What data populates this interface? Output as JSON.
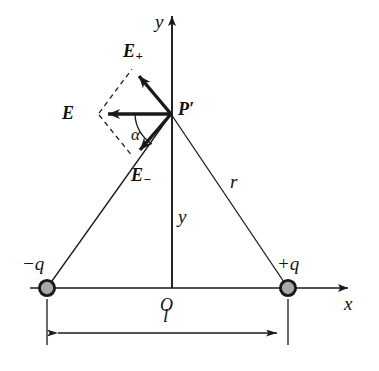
{
  "figure": {
    "type": "physics-vector-diagram",
    "background_color": "#ffffff",
    "stroke_color": "#1a1a1a",
    "charge_fill_color": "#a8a8a8",
    "charge_ring_color": "#1a1a1a"
  },
  "axes": {
    "y_label": "y",
    "x_label": "x",
    "origin_label": "O",
    "y_axis": {
      "x": 172,
      "top_y": 10,
      "bottom_y": 288
    },
    "x_axis": {
      "y": 288,
      "left_x": 30,
      "right_x": 355
    }
  },
  "point": {
    "label": "P",
    "prime": "′",
    "full_label": "P′",
    "x": 171,
    "y": 114
  },
  "charges": [
    {
      "name": "negative-charge",
      "label_sign": "−",
      "label_symbol": "q",
      "full_label": "−q",
      "x": 47,
      "y": 288,
      "radius": 8
    },
    {
      "name": "positive-charge",
      "label_sign": "+",
      "label_symbol": "q",
      "full_label": "+q",
      "x": 288,
      "y": 288,
      "radius": 8
    }
  ],
  "vectors": [
    {
      "name": "E-plus",
      "label": "E",
      "subscript": "+",
      "from_x": 171,
      "from_y": 114,
      "to_x": 133,
      "to_y": 69,
      "style": "solid-bold"
    },
    {
      "name": "E-resultant",
      "label": "E",
      "subscript": "",
      "from_x": 171,
      "from_y": 114,
      "to_x": 98,
      "to_y": 114,
      "style": "solid-bold"
    },
    {
      "name": "E-minus",
      "label": "E",
      "subscript": "−",
      "from_x": 171,
      "from_y": 114,
      "to_x": 133,
      "to_y": 158,
      "style": "solid-bold"
    }
  ],
  "construction_lines": [
    {
      "name": "dashed-parallelogram-upper",
      "from_x": 98,
      "from_y": 114,
      "to_x": 133,
      "to_y": 69
    },
    {
      "name": "dashed-parallelogram-lower",
      "from_x": 98,
      "from_y": 114,
      "to_x": 133,
      "to_y": 158
    }
  ],
  "segments": [
    {
      "name": "segment-to-negative-charge",
      "label": "",
      "from_x": 171,
      "from_y": 114,
      "to_x": 47,
      "to_y": 288
    },
    {
      "name": "segment-to-positive-charge",
      "label": "r",
      "from_x": 171,
      "from_y": 114,
      "to_x": 288,
      "to_y": 288
    }
  ],
  "labels": {
    "angle": "α",
    "height": "y",
    "distance": "r",
    "separation": "l"
  },
  "dimension": {
    "name": "dipole-separation",
    "label": "l",
    "y": 333,
    "left_x": 47,
    "right_x": 288,
    "tick_top_y": 297,
    "tick_bottom_y": 345
  }
}
